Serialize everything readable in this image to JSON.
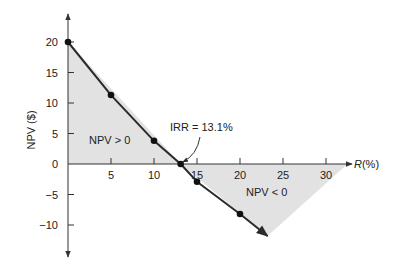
{
  "chart_data": {
    "type": "line",
    "title": "",
    "xlabel": "R(%)",
    "xlabel_italic_part": "R",
    "xlabel_rest": "(%)",
    "ylabel": "NPV ($)",
    "xlim": [
      0,
      33
    ],
    "ylim": [
      -14,
      23
    ],
    "xticks": [
      5,
      10,
      15,
      20,
      25,
      30
    ],
    "yticks": [
      20,
      15,
      10,
      5,
      0,
      -5,
      -10
    ],
    "grid": false,
    "legend": "none",
    "series": [
      {
        "name": "NPV profile",
        "x": [
          0,
          5,
          10,
          13.1,
          15,
          20
        ],
        "y": [
          20,
          11.3,
          3.8,
          0,
          -2.9,
          -8.2
        ],
        "curve_end": [
          23.2,
          -11.8
        ],
        "markers": true
      }
    ],
    "regions": [
      {
        "name": "positive",
        "label": "NPV > 0",
        "polygon": [
          [
            0,
            20
          ],
          [
            13.1,
            0
          ],
          [
            0,
            0
          ]
        ]
      },
      {
        "name": "negative",
        "label": "NPV < 0",
        "polygon": [
          [
            13.1,
            0
          ],
          [
            32.5,
            0
          ],
          [
            23.2,
            -11.8
          ]
        ]
      }
    ],
    "annotations": [
      {
        "text": "IRR = 13.1%",
        "points_to": [
          13.1,
          0
        ]
      }
    ],
    "colors": {
      "fill": "#e2e2e2",
      "line": "#2a2a2a",
      "axis": "#333333"
    }
  }
}
